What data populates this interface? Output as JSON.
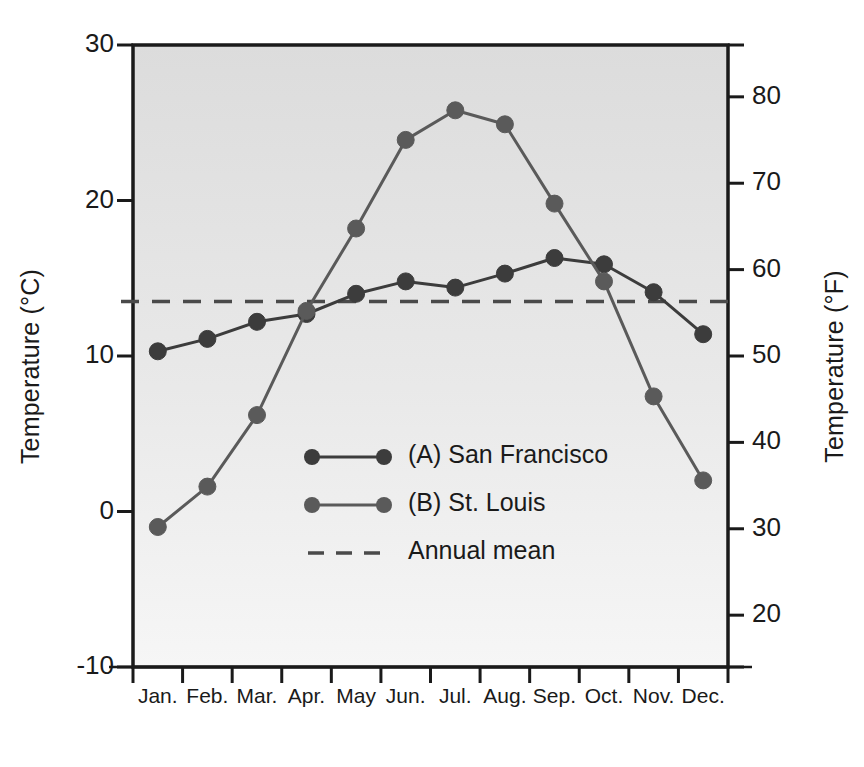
{
  "chart_data": {
    "type": "line",
    "title": "",
    "subtitle": "",
    "xlabel": "",
    "ylabel": "Temperature (°C)",
    "ylabel_secondary": "Temperature (°F)",
    "categories": [
      "Jan.",
      "Feb.",
      "Mar.",
      "Apr.",
      "May",
      "Jun.",
      "Jul.",
      "Aug.",
      "Sep.",
      "Oct.",
      "Nov.",
      "Dec."
    ],
    "ylim": [
      -10,
      30
    ],
    "ylim_secondary": [
      14,
      86
    ],
    "yticks": [
      30,
      20,
      10,
      0,
      -10
    ],
    "ytick_labels": [
      "30",
      "20",
      "10",
      "0",
      "-10"
    ],
    "yticks_secondary": [
      80,
      70,
      60,
      50,
      40,
      30,
      20
    ],
    "ytick_labels_secondary": [
      "80",
      "70",
      "60",
      "50",
      "40",
      "30",
      "20"
    ],
    "grid": false,
    "legend_position": "center",
    "series": [
      {
        "name": "(A) San Francisco",
        "marker": "circle",
        "linestyle": "solid",
        "color": "#3c3c3c",
        "values": [
          10.3,
          11.1,
          12.2,
          12.7,
          14.0,
          14.8,
          14.4,
          15.3,
          16.3,
          15.9,
          14.1,
          11.4
        ]
      },
      {
        "name": "(B) St. Louis",
        "marker": "circle",
        "linestyle": "solid",
        "color": "#5a5a5a",
        "values": [
          -1.0,
          1.6,
          6.2,
          12.9,
          18.2,
          23.9,
          25.8,
          24.9,
          19.8,
          14.8,
          7.4,
          2.0
        ]
      }
    ],
    "reference_lines": [
      {
        "name": "Annual mean",
        "value": 13.5,
        "linestyle": "dashed",
        "color": "#4a4a4a"
      }
    ]
  },
  "legend": {
    "items": [
      {
        "label": "(A) San Francisco",
        "style": "line-marker"
      },
      {
        "label": "(B) St. Louis",
        "style": "line-marker"
      },
      {
        "label": "Annual mean",
        "style": "dashed"
      }
    ]
  },
  "axes": {
    "left_title": "Temperature (°C)",
    "right_title": "Temperature (°F)"
  },
  "colors": {
    "plot_background_top": "#dedede",
    "plot_background_bottom": "#f4f4f4",
    "axis": "#1a1a1a",
    "series_a": "#3c3c3c",
    "series_b": "#5a5a5a",
    "reference": "#4a4a4a"
  }
}
